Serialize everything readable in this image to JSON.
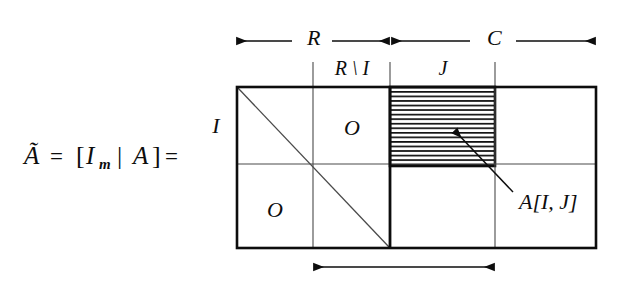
{
  "figure": {
    "kind": "matrix-block-diagram"
  },
  "formula": {
    "text": "Ã = [Iₘ | A] =",
    "a_tilde": "Ã",
    "equals_1": "=",
    "bracket_open": "[",
    "identity": "I",
    "identity_subscript": "m",
    "pipe": "|",
    "matrix_a": "A",
    "bracket_close": "]",
    "equals_2": "="
  },
  "top_axis": {
    "left_span_label": "R",
    "right_span_label": "C"
  },
  "column_labels": {
    "r_minus_i": "R \\ I",
    "j": "J"
  },
  "row_labels": {
    "i": "I"
  },
  "blocks": {
    "zero_top_right": "O",
    "zero_bottom_left": "O"
  },
  "callout": {
    "label": "A[I, J]"
  },
  "geometry": {
    "box_left": 237,
    "box_right": 596,
    "box_top": 87,
    "box_bottom": 248,
    "divider_thick_x": 390,
    "divider_thin_left_x": 313,
    "divider_thin_right_x": 495,
    "divider_row_y": 164,
    "hatch_bottom_y": 166,
    "top_arrow_y": 41,
    "bottom_arrow_y": 267,
    "hatch_line_count": 17
  },
  "colors": {
    "ink": "#0d0d0d",
    "thin_rule": "#3a3a3a",
    "background": "#ffffff"
  }
}
